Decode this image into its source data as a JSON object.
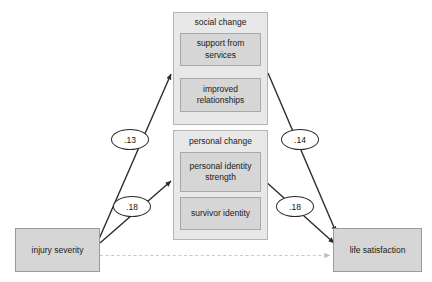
{
  "diagram": {
    "type": "path-diagram",
    "nodes": {
      "predictor": {
        "label": "injury severity"
      },
      "outcome": {
        "label": "life satisfaction"
      },
      "mediator_social": {
        "label": "social change",
        "indicators": [
          {
            "label": "support from services"
          },
          {
            "label": "improved relationships"
          }
        ]
      },
      "mediator_personal": {
        "label": "personal change",
        "indicators": [
          {
            "label": "personal identity strength"
          },
          {
            "label": "survivor identity"
          }
        ]
      }
    },
    "paths": [
      {
        "id": "p1",
        "from": "injury severity",
        "to": "social change",
        "coefficient": ".13",
        "style": "solid"
      },
      {
        "id": "p2",
        "from": "injury severity",
        "to": "personal change",
        "coefficient": ".18",
        "style": "solid"
      },
      {
        "id": "p3",
        "from": "social change",
        "to": "life satisfaction",
        "coefficient": ".14",
        "style": "solid"
      },
      {
        "id": "p4",
        "from": "personal change",
        "to": "life satisfaction",
        "coefficient": ".18",
        "style": "solid"
      },
      {
        "id": "p5",
        "from": "injury severity",
        "to": "life satisfaction",
        "coefficient": "",
        "style": "dashed"
      }
    ],
    "colors": {
      "box_fill": "#d6d6d6",
      "group_fill": "#e8e8e8",
      "box_border": "#9a9a9a",
      "arrow": "#2b2b2b",
      "dashed_arrow": "#c4c4c4",
      "background": "#ffffff"
    }
  }
}
